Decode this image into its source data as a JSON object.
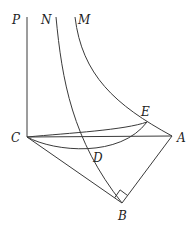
{
  "diagram": {
    "type": "geometry",
    "labels": {
      "P": "P",
      "N": "N",
      "M": "M",
      "C": "C",
      "A": "A",
      "E": "E",
      "D": "D",
      "B": "B"
    },
    "points": {
      "C": [
        27,
        137
      ],
      "A": [
        172,
        136
      ],
      "B": [
        122,
        203
      ],
      "E": [
        147,
        122
      ],
      "P_top": [
        27,
        17
      ],
      "N_top": [
        56,
        17
      ],
      "M_top": [
        75,
        17
      ]
    },
    "right_angle_at": "B",
    "stroke_color": "#3a3a3a"
  }
}
